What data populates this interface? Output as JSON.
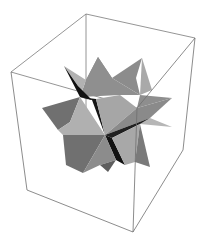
{
  "figure": {
    "title": "",
    "colors": {
      "background": "#ffffff",
      "box_edge": "#6e6e6e",
      "face_light": "#b4b4b4",
      "face_mid": "#8c8c8c",
      "face_dark": "#6a6a6a",
      "face_black": "#111111"
    },
    "box": {
      "corners": {
        "top_back": [
          86,
          14
        ],
        "top_left": [
          11,
          72
        ],
        "top_right": [
          195,
          38
        ],
        "top_front": [
          137,
          108
        ],
        "bottom_left": [
          27,
          190
        ],
        "bottom_front": [
          133,
          232
        ],
        "bottom_right": [
          183,
          150
        ]
      }
    }
  }
}
